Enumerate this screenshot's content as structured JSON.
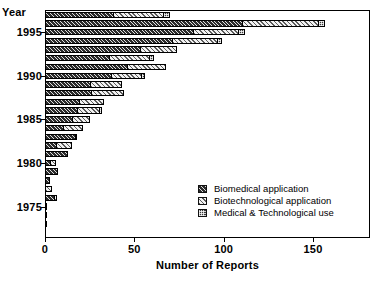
{
  "chart_data": {
    "type": "bar",
    "orientation": "horizontal",
    "stacked": true,
    "title": "",
    "xlabel": "Number of Reports",
    "ylabel": "Year",
    "xlim": [
      0,
      180
    ],
    "xticks": [
      0,
      50,
      100,
      150
    ],
    "xtick_labels": [
      "0",
      "50",
      "100",
      "150"
    ],
    "yticks": [
      1975,
      1980,
      1985,
      1990,
      1995
    ],
    "ytick_labels": [
      "1975",
      "1980",
      "1985",
      "1990",
      "1995"
    ],
    "grid": false,
    "legend_position": "lower right",
    "categories": [
      1997,
      1996,
      1995,
      1994,
      1993,
      1992,
      1991,
      1990,
      1989,
      1988,
      1987,
      1986,
      1985,
      1984,
      1983,
      1982,
      1981,
      1980,
      1979,
      1978,
      1977,
      1976,
      1975,
      1974,
      1973
    ],
    "series": [
      {
        "name": "Biomedical application",
        "fill": "fill-biomedical",
        "values": [
          38,
          110,
          83,
          71,
          53,
          36,
          46,
          37,
          25,
          26,
          19,
          18,
          15,
          10,
          17,
          6,
          13,
          3,
          7,
          3,
          0,
          5,
          0,
          1,
          0
        ]
      },
      {
        "name": "Biotechnological application",
        "fill": "fill-biotech",
        "values": [
          28,
          43,
          25,
          25,
          21,
          22,
          22,
          17,
          18,
          18,
          14,
          12,
          10,
          11,
          1,
          9,
          0,
          3,
          0,
          0,
          4,
          2,
          0,
          0,
          1
        ]
      },
      {
        "name": "Medical & Technological use",
        "fill": "fill-medtech",
        "values": [
          4,
          4,
          4,
          3,
          0,
          3,
          0,
          2,
          0,
          0,
          0,
          2,
          0,
          0,
          0,
          0,
          0,
          0,
          0,
          0,
          0,
          0,
          1,
          0,
          0
        ]
      }
    ],
    "legend": [
      {
        "label": "Biomedical application",
        "fill": "fill-biomedical"
      },
      {
        "label": "Biotechnological application",
        "fill": "fill-biotech"
      },
      {
        "label": "Medical & Technological use",
        "fill": "fill-medtech"
      }
    ]
  }
}
